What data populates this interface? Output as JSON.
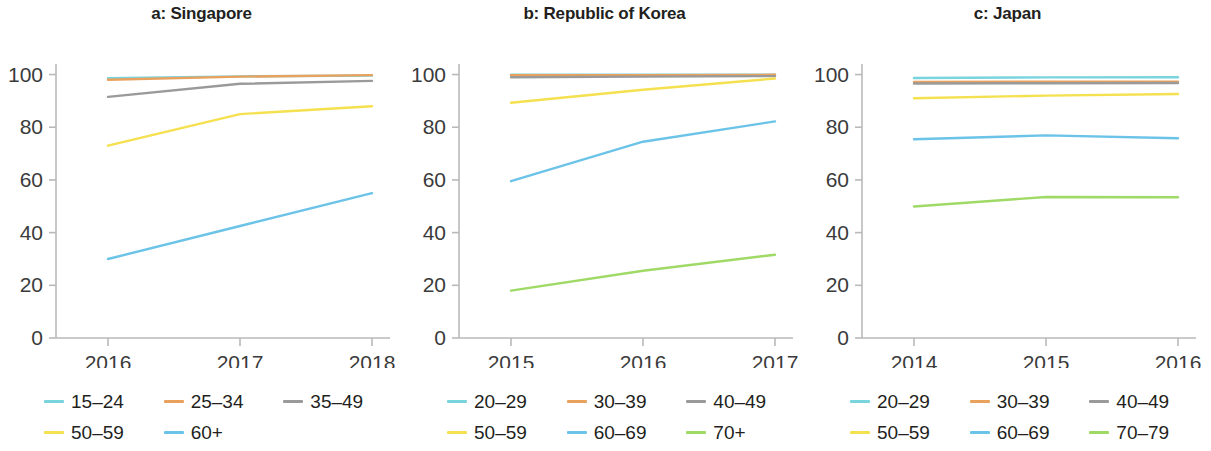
{
  "figure": {
    "panel_count": 3
  },
  "chart_data": [
    {
      "type": "line",
      "title": "a: Singapore",
      "xlabel": "",
      "ylabel": "",
      "x": [
        "2016",
        "2017",
        "2018"
      ],
      "xticklabels": [
        "2016",
        "2017",
        "2018"
      ],
      "yticklabels": [
        "0",
        "20",
        "40",
        "60",
        "80",
        "100"
      ],
      "yticks": [
        0,
        20,
        40,
        60,
        80,
        100
      ],
      "ylim": [
        0,
        104
      ],
      "grid": false,
      "legend_position": "bottom",
      "series": [
        {
          "name": "15–24",
          "color": "#7ad4de",
          "values": [
            98.6,
            99.3,
            99.6
          ]
        },
        {
          "name": "25–34",
          "color": "#e9a15d",
          "values": [
            98.0,
            99.2,
            99.8
          ]
        },
        {
          "name": "35–49",
          "color": "#9a9a9a",
          "values": [
            91.5,
            96.5,
            97.6
          ]
        },
        {
          "name": "50–59",
          "color": "#f5e04f",
          "values": [
            73.0,
            85.0,
            88.0
          ]
        },
        {
          "name": "60+",
          "color": "#6cc3e8",
          "values": [
            30.0,
            42.5,
            55.0
          ]
        }
      ]
    },
    {
      "type": "line",
      "title": "b: Republic of Korea",
      "xlabel": "",
      "ylabel": "",
      "x": [
        "2015",
        "2016",
        "2017"
      ],
      "xticklabels": [
        "2015",
        "2016",
        "2017"
      ],
      "yticklabels": [
        "0",
        "20",
        "40",
        "60",
        "80",
        "100"
      ],
      "yticks": [
        0,
        20,
        40,
        60,
        80,
        100
      ],
      "ylim": [
        0,
        104
      ],
      "grid": false,
      "legend_position": "bottom",
      "series": [
        {
          "name": "20–29",
          "color": "#7ad4de",
          "values": [
            99.9,
            99.9,
            99.9
          ]
        },
        {
          "name": "30–39",
          "color": "#e9a15d",
          "values": [
            99.7,
            99.8,
            99.9
          ]
        },
        {
          "name": "40–49",
          "color": "#9a9a9a",
          "values": [
            99.0,
            99.2,
            99.4
          ]
        },
        {
          "name": "50–59",
          "color": "#f5e04f",
          "values": [
            89.3,
            94.2,
            98.5
          ]
        },
        {
          "name": "60–69",
          "color": "#6cc3e8",
          "values": [
            59.5,
            74.5,
            82.2
          ]
        },
        {
          "name": "70+",
          "color": "#9fd966",
          "values": [
            18.0,
            25.5,
            31.6
          ]
        }
      ]
    },
    {
      "type": "line",
      "title": "c: Japan",
      "xlabel": "",
      "ylabel": "",
      "x": [
        "2014",
        "2015",
        "2016"
      ],
      "xticklabels": [
        "2014",
        "2015",
        "2016"
      ],
      "yticklabels": [
        "0",
        "20",
        "40",
        "60",
        "80",
        "100"
      ],
      "yticks": [
        0,
        20,
        40,
        60,
        80,
        100
      ],
      "ylim": [
        0,
        104
      ],
      "grid": false,
      "legend_position": "bottom",
      "series": [
        {
          "name": "20–29",
          "color": "#7ad4de",
          "values": [
            98.7,
            98.9,
            99.0
          ]
        },
        {
          "name": "30–39",
          "color": "#e9a15d",
          "values": [
            97.2,
            97.3,
            97.3
          ]
        },
        {
          "name": "40–49",
          "color": "#9a9a9a",
          "values": [
            96.6,
            96.7,
            96.8
          ]
        },
        {
          "name": "50–59",
          "color": "#f5e04f",
          "values": [
            91.0,
            92.0,
            92.6
          ]
        },
        {
          "name": "60–69",
          "color": "#6cc3e8",
          "values": [
            75.4,
            76.9,
            75.8
          ]
        },
        {
          "name": "70–79",
          "color": "#9fd966",
          "values": [
            49.9,
            53.5,
            53.4
          ]
        }
      ]
    }
  ]
}
